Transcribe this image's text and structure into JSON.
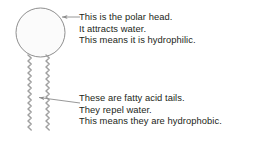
{
  "diagram": {
    "title_present": false,
    "background_color": "#ffffff",
    "line_color": "#8c8c8c",
    "text_color": "#231f20",
    "head": {
      "shape": "circle",
      "label_name": "polar-head",
      "cx": 40.5,
      "cy": 32.5,
      "r": 24.5,
      "fill": "#fbfbfb",
      "stroke": "#8f8f8f"
    },
    "tails": {
      "count": 2,
      "label_name": "fatty-acid-tails",
      "stroke": "#a0a0a0",
      "x_positions": [
        28,
        46
      ],
      "top_y": 55,
      "bottom_y": 131,
      "zigzag_amplitude": 3.2,
      "zigzag_segment": 6
    },
    "leaders": [
      {
        "name": "leader-head",
        "from_x": 80,
        "from_y": 17,
        "to_x": 61,
        "to_y": 17,
        "arrowhead": "end"
      },
      {
        "name": "leader-tails",
        "from_x": 80,
        "from_y": 103,
        "to_x": 38,
        "to_y": 97,
        "arrowhead": "end"
      }
    ]
  },
  "callouts": {
    "head": {
      "name": "polar-head-callout",
      "lines": [
        "This is the polar head.",
        "It attracts water.",
        "This means it is hydrophilic."
      ]
    },
    "tails": {
      "name": "fatty-acid-tails-callout",
      "lines": [
        "These are fatty acid tails.",
        "They repel water.",
        "This means they are hydrophobic."
      ]
    }
  }
}
